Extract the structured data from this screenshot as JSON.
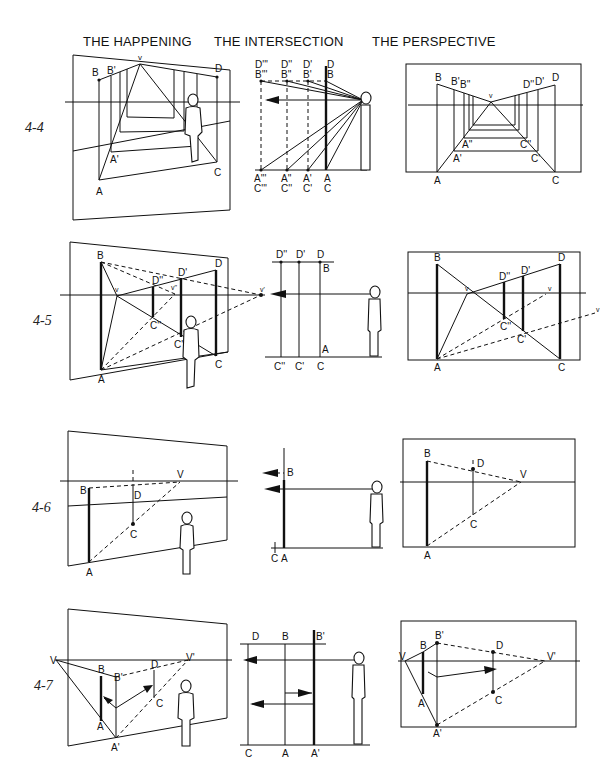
{
  "columns": {
    "happening": "THE HAPPENING",
    "intersection": "THE INTERSECTION",
    "perspective": "THE PERSPECTIVE"
  },
  "figures": [
    {
      "id": "4-4",
      "label": "4-4",
      "happening": {
        "points": [
          "B",
          "B'",
          "v",
          "D",
          "A'",
          "A",
          "C"
        ]
      },
      "intersection": {
        "top_labels": [
          "D'''",
          "B'''",
          "D''",
          "B''",
          "D'",
          "B'",
          "D",
          "B"
        ],
        "bottom_labels": [
          "A'''",
          "C'''",
          "A''",
          "C''",
          "A'",
          "C'",
          "A",
          "C"
        ]
      },
      "perspective": {
        "points": [
          "B",
          "B'",
          "B''",
          "v",
          "D''",
          "D'",
          "D",
          "A''",
          "C''",
          "A'",
          "C'",
          "A",
          "C"
        ]
      }
    },
    {
      "id": "4-5",
      "label": "4-5",
      "happening": {
        "points": [
          "B",
          "D''",
          "D'",
          "D",
          "v",
          "v''",
          "v'",
          "C''",
          "C'",
          "C",
          "A"
        ]
      },
      "intersection": {
        "top_labels": [
          "D''",
          "D'",
          "D",
          "B"
        ],
        "bottom_labels": [
          "C''",
          "C'",
          "C",
          "A"
        ]
      },
      "perspective": {
        "points": [
          "B",
          "D''",
          "D'",
          "D",
          "v",
          "v",
          "v",
          "C''",
          "C'",
          "A",
          "C"
        ]
      }
    },
    {
      "id": "4-6",
      "label": "4-6",
      "happening": {
        "points": [
          "B",
          "D",
          "V",
          "C",
          "A"
        ]
      },
      "intersection": {
        "points": [
          "B",
          "C",
          "A"
        ]
      },
      "perspective": {
        "points": [
          "B",
          "D",
          "V",
          "C",
          "A"
        ]
      }
    },
    {
      "id": "4-7",
      "label": "4-7",
      "happening": {
        "points": [
          "V",
          "B",
          "B'",
          "D",
          "V'",
          "C",
          "A",
          "A'"
        ]
      },
      "intersection": {
        "top_labels": [
          "D",
          "B",
          "B'"
        ],
        "bottom_labels": [
          "C",
          "A",
          "A'"
        ]
      },
      "perspective": {
        "points": [
          "V",
          "B",
          "B'",
          "D",
          "V'",
          "A",
          "C",
          "A'"
        ]
      }
    }
  ]
}
